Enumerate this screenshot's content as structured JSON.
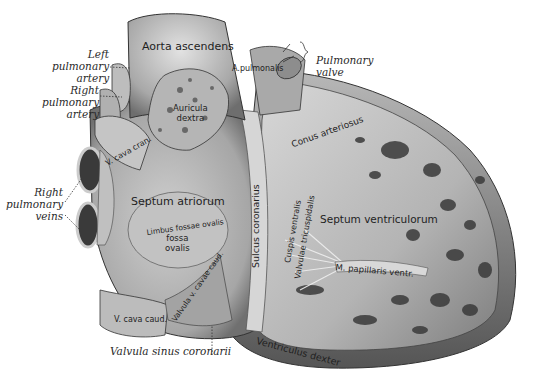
{
  "figure": {
    "colors": {
      "background": "#ffffff",
      "tissue_light": "#d6d6d6",
      "tissue_mid": "#9a9a9a",
      "tissue_dark": "#3a3a3a",
      "ink": "#222222"
    }
  },
  "external_labels": {
    "left_pulmonary_artery": [
      "Left",
      "pulmonary",
      "artery"
    ],
    "right_pulmonary_artery": [
      "Right",
      "pulmonary",
      "artery"
    ],
    "right_pulmonary_veins": [
      "Right",
      "pulmonary",
      "veins"
    ],
    "pulmonary_valve": [
      "Pulmonary",
      "valve"
    ],
    "valvula_sinus_coronarii": "Valvula sinus coronarii"
  },
  "internal_labels": {
    "aorta_ascendens": "Aorta ascendens",
    "a_pulmonalis": "A.pulmonalis",
    "auricula_dextra": [
      "Auricula",
      "dextra"
    ],
    "v_cava_cran": "V. cava cran.",
    "conus_arteriosus": "Conus arteriosus",
    "septum_atriorum": "Septum atriorum",
    "limbus_fossae_ovalis": "Limbus fossae ovalis",
    "fossa_ovalis": [
      "fossa",
      "ovalis"
    ],
    "sulcus_coronarius": "Sulcus coronarius",
    "septum_ventriculorum": "Septum ventriculorum",
    "cuspis_ventralis": "Cuspis ventralis",
    "valvulae_tricuspidalis": "Valvulae tricuspidalis",
    "m_papillaris_ventr": "M. papillaris ventr.",
    "valvula_v_cavae_caud": "Valvula v. cavae caud.",
    "v_cava_caud": "V. cava caud.",
    "ventriculus_dexter": "Ventriculus dexter"
  }
}
